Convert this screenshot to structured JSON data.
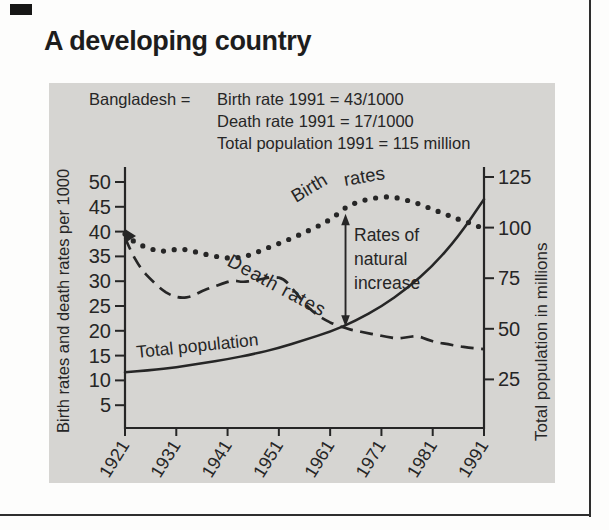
{
  "page": {
    "title": "A developing country"
  },
  "colors": {
    "ink": "#262626",
    "panel_bg": "#d6d5d2"
  },
  "panel": {
    "legend": {
      "country_label": "Bangladesh =",
      "lines": [
        "Birth rate 1991 = 43/1000",
        "Death rate 1991 = 17/1000",
        "Total population 1991 = 115 million"
      ]
    }
  },
  "chart_data": {
    "type": "line",
    "title": "",
    "x_axis": {
      "tick_years": [
        "1921",
        "1931",
        "1941",
        "1951",
        "1961",
        "1971",
        "1981",
        "1991"
      ],
      "range": [
        1921,
        1991
      ]
    },
    "left_axis": {
      "label": "Birth rates and death rates per 1000",
      "ticks": [
        50,
        45,
        40,
        35,
        30,
        25,
        20,
        15,
        10,
        5
      ],
      "range": [
        0,
        53
      ]
    },
    "right_axis": {
      "label": "Total population in millions",
      "ticks": [
        125,
        100,
        75,
        50,
        25
      ],
      "range": [
        0,
        132
      ]
    },
    "series": [
      {
        "name": "Birth rates",
        "axis": "left",
        "style": "dotted",
        "points": [
          [
            1921,
            39.5
          ],
          [
            1922,
            38.5
          ],
          [
            1924,
            37.3
          ],
          [
            1926,
            36.5
          ],
          [
            1928,
            36.0
          ],
          [
            1930,
            36.3
          ],
          [
            1932,
            36.5
          ],
          [
            1934,
            36.1
          ],
          [
            1936,
            35.6
          ],
          [
            1938,
            35.1
          ],
          [
            1940,
            34.8
          ],
          [
            1942,
            34.6
          ],
          [
            1944,
            34.9
          ],
          [
            1946,
            35.5
          ],
          [
            1948,
            36.4
          ],
          [
            1950,
            37.2
          ],
          [
            1952,
            38.0
          ],
          [
            1954,
            38.9
          ],
          [
            1956,
            39.8
          ],
          [
            1958,
            40.8
          ],
          [
            1960,
            41.8
          ],
          [
            1962,
            43.2
          ],
          [
            1964,
            44.8
          ],
          [
            1966,
            45.8
          ],
          [
            1968,
            46.4
          ],
          [
            1970,
            46.8
          ],
          [
            1972,
            47.0
          ],
          [
            1974,
            46.8
          ],
          [
            1976,
            46.3
          ],
          [
            1978,
            45.7
          ],
          [
            1980,
            44.9
          ],
          [
            1982,
            44.1
          ],
          [
            1984,
            43.3
          ],
          [
            1986,
            42.5
          ],
          [
            1988,
            41.8
          ],
          [
            1990,
            41.0
          ]
        ]
      },
      {
        "name": "Death rates",
        "axis": "left",
        "style": "dashed",
        "points": [
          [
            1921,
            38.8
          ],
          [
            1922,
            36.3
          ],
          [
            1924,
            32.6
          ],
          [
            1926,
            30.4
          ],
          [
            1928,
            28.4
          ],
          [
            1930,
            27.1
          ],
          [
            1932,
            26.6
          ],
          [
            1934,
            26.9
          ],
          [
            1936,
            28.0
          ],
          [
            1938,
            28.8
          ],
          [
            1940,
            29.5
          ],
          [
            1942,
            30.2
          ],
          [
            1944,
            29.8
          ],
          [
            1946,
            30.1
          ],
          [
            1948,
            30.5
          ],
          [
            1950,
            30.9
          ],
          [
            1952,
            30.5
          ],
          [
            1954,
            28.1
          ],
          [
            1956,
            25.5
          ],
          [
            1958,
            23.5
          ],
          [
            1960,
            22.2
          ],
          [
            1962,
            21.2
          ],
          [
            1964,
            20.5
          ],
          [
            1966,
            20.0
          ],
          [
            1968,
            19.6
          ],
          [
            1970,
            19.2
          ],
          [
            1972,
            18.8
          ],
          [
            1974,
            18.4
          ],
          [
            1976,
            18.7
          ],
          [
            1978,
            19.0
          ],
          [
            1980,
            18.2
          ],
          [
            1982,
            17.6
          ],
          [
            1984,
            17.3
          ],
          [
            1986,
            16.9
          ],
          [
            1988,
            16.6
          ],
          [
            1990,
            16.4
          ],
          [
            1991,
            16.3
          ]
        ]
      },
      {
        "name": "Total population",
        "axis": "right",
        "style": "solid",
        "points": [
          [
            1921,
            28.5
          ],
          [
            1926,
            29.5
          ],
          [
            1931,
            31.0
          ],
          [
            1936,
            33.0
          ],
          [
            1941,
            35.0
          ],
          [
            1946,
            37.5
          ],
          [
            1951,
            40.5
          ],
          [
            1956,
            44.5
          ],
          [
            1961,
            48.5
          ],
          [
            1966,
            54.0
          ],
          [
            1971,
            61.0
          ],
          [
            1976,
            70.0
          ],
          [
            1981,
            81.0
          ],
          [
            1986,
            95.5
          ],
          [
            1991,
            114.0
          ]
        ]
      }
    ],
    "curve_labels": {
      "birth_word1": "Birth",
      "birth_word2": "rates",
      "death": "Death rates",
      "population": "Total population"
    },
    "annotation": {
      "lines": [
        "Rates of",
        "natural",
        "increase"
      ],
      "arrow_year": 1964,
      "arrow_from_value": 43.6,
      "arrow_to_value": 20.8
    }
  }
}
